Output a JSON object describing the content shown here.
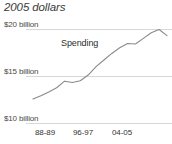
{
  "chart_data": {
    "type": "line",
    "title": "2005 dollars",
    "subtitle": "",
    "xlabel": "",
    "ylabel": "",
    "grid": true,
    "legend_position": "inline-annotation",
    "annotations": [
      {
        "text": "Spending",
        "x_px": 61,
        "y_px": 38
      }
    ],
    "ylim": [
      10,
      20.6
    ],
    "y_ticks": [
      10,
      15,
      20
    ],
    "y_tick_labels": [
      "$10 billion",
      "$15 billion",
      "$20 billion"
    ],
    "x_ticks": [
      "88-89",
      "96-97",
      "04-05"
    ],
    "x_tick_labels": [
      "88-89",
      "96-97",
      "04-05"
    ],
    "series": [
      {
        "name": "Spending",
        "color": "#8a8a8a",
        "x": [
          "88-89",
          "89-90",
          "90-91",
          "91-92",
          "92-93",
          "93-94",
          "94-95",
          "95-96",
          "96-97",
          "97-98",
          "98-99",
          "99-00",
          "00-01",
          "01-02",
          "02-03",
          "03-04",
          "04-05",
          "05-06"
        ],
        "values": [
          12.55,
          12.9,
          13.3,
          13.75,
          14.45,
          14.3,
          14.5,
          15.1,
          16.0,
          16.7,
          17.4,
          18.0,
          18.45,
          18.4,
          19.0,
          19.6,
          19.95,
          19.3
        ]
      }
    ]
  },
  "chart": {
    "title": "2005 dollars",
    "annotation_spending": "Spending",
    "y_tick_labels": [
      "$20 billion",
      "$15 billion",
      "$10 billion"
    ],
    "x_tick_labels": [
      "88-89",
      "96-97",
      "04-05"
    ],
    "colors": {
      "line": "#8a8a8a",
      "gridline": "#d8d8d8",
      "title_text": "#3a3a3a",
      "tick_text": "#4a4a4a",
      "background": "#ffffff"
    }
  }
}
